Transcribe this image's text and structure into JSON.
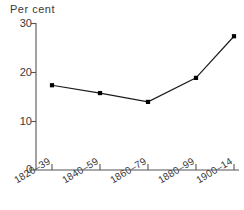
{
  "chart_data": {
    "type": "line",
    "title": "",
    "subtitle": "",
    "ylabel": "Per cent",
    "xlabel": "",
    "categories": [
      "1820–39",
      "1840–59",
      "1860–79",
      "1880–99",
      "1900–14"
    ],
    "values": [
      17.3,
      15.7,
      13.9,
      18.8,
      27.3
    ],
    "series": [
      {
        "name": "Per cent",
        "values": [
          17.3,
          15.7,
          13.9,
          18.8,
          27.3
        ]
      }
    ],
    "ylim": [
      0,
      30
    ],
    "yticks": [
      0,
      10,
      20,
      30
    ],
    "ytick_labels": [
      "0",
      "10",
      "20",
      "30"
    ],
    "grid": false,
    "legend": false,
    "legend_position": "none",
    "marker": "filled-square",
    "line_color": "#1a1a1a",
    "marker_color": "#000000",
    "axis_color": "#555555",
    "background_color": "#ffffff",
    "xtick_label_rotation": -31
  },
  "axis": {
    "y_title": "Per cent"
  }
}
